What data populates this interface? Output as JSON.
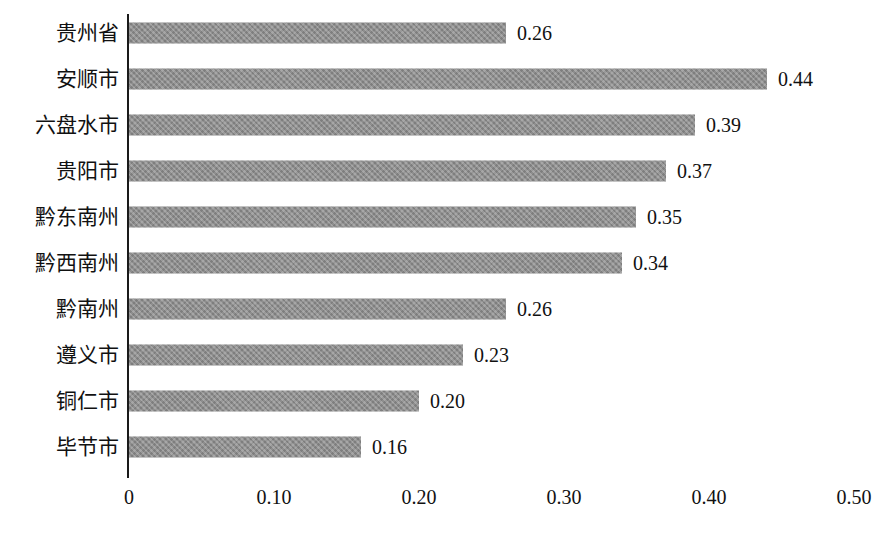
{
  "chart_data": {
    "type": "bar",
    "orientation": "horizontal",
    "title": "",
    "subtitle": "",
    "xlabel": "",
    "ylabel": "",
    "xlim": [
      0,
      0.5
    ],
    "grid": false,
    "legend": false,
    "legend_position": "none",
    "bar_color": "#8a8a8a",
    "axis_color": "#1a1a1a",
    "text_color": "#111111",
    "background": "#ffffff",
    "xticks": [
      "0",
      "0.10",
      "0.20",
      "0.30",
      "0.40",
      "0.50"
    ],
    "xtick_values": [
      0,
      0.1,
      0.2,
      0.3,
      0.4,
      0.5
    ],
    "categories": [
      "贵州省",
      "安顺市",
      "六盘水市",
      "贵阳市",
      "黔东南州",
      "黔西南州",
      "黔南州",
      "遵义市",
      "铜仁市",
      "毕节市"
    ],
    "values": [
      0.26,
      0.44,
      0.39,
      0.37,
      0.35,
      0.34,
      0.26,
      0.23,
      0.2,
      0.16
    ],
    "value_labels": [
      "0.26",
      "0.44",
      "0.39",
      "0.37",
      "0.35",
      "0.34",
      "0.26",
      "0.23",
      "0.20",
      "0.16"
    ]
  }
}
